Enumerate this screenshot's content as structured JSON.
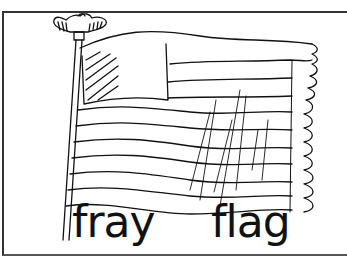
{
  "illustration": {
    "subject": "waving striped flag on a pole topped with an eagle finial, frayed right edge",
    "icons": [
      "eagle-finial-icon",
      "flagpole-icon",
      "flag-icon"
    ],
    "line_color": "#111111",
    "background": "#ffffff"
  },
  "words": [
    {
      "text": "fray"
    },
    {
      "text": "flag"
    }
  ]
}
